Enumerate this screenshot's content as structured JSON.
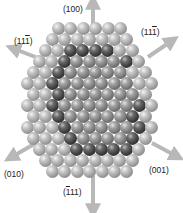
{
  "diagram": {
    "type": "crystal-facet-sphere-model",
    "colors": {
      "outer_sphere": "#a0a0a0",
      "inner_core": "#6e6e6e",
      "core_edge": "#2e2e2e",
      "arrow": "#b8b8b8",
      "label_text": "#222222"
    },
    "sphere_diameter": 13,
    "rows": [
      {
        "y": 22,
        "x0": 52,
        "n": 6,
        "inner": [],
        "edge": []
      },
      {
        "y": 33,
        "x0": 46,
        "n": 7,
        "inner": [],
        "edge": []
      },
      {
        "y": 44,
        "x0": 39,
        "n": 8,
        "inner": [
          3,
          4,
          5
        ],
        "edge": [
          2,
          3,
          4,
          5
        ]
      },
      {
        "y": 55,
        "x0": 33,
        "n": 9,
        "inner": [
          3,
          4,
          5,
          6
        ],
        "edge": [
          2,
          7
        ]
      },
      {
        "y": 66,
        "x0": 27,
        "n": 10,
        "inner": [
          3,
          4,
          5,
          6,
          7
        ],
        "edge": [
          2
        ]
      },
      {
        "y": 77,
        "x0": 21,
        "n": 11,
        "inner": [
          3,
          4,
          5,
          6,
          7,
          8
        ],
        "edge": [
          2
        ]
      },
      {
        "y": 88,
        "x0": 27,
        "n": 10,
        "inner": [
          3,
          4,
          5,
          6,
          7,
          8
        ],
        "edge": [
          2
        ]
      },
      {
        "y": 99,
        "x0": 21,
        "n": 11,
        "inner": [
          3,
          4,
          5,
          6,
          7,
          8
        ],
        "edge": [
          2,
          9
        ]
      },
      {
        "y": 110,
        "x0": 27,
        "n": 10,
        "inner": [
          3,
          4,
          5,
          6,
          7,
          8
        ],
        "edge": [
          2,
          8
        ]
      },
      {
        "y": 121,
        "x0": 21,
        "n": 11,
        "inner": [
          4,
          5,
          6,
          7,
          8
        ],
        "edge": [
          3,
          9
        ]
      },
      {
        "y": 132,
        "x0": 27,
        "n": 10,
        "inner": [
          4,
          5,
          6,
          7
        ],
        "edge": [
          3,
          8
        ]
      },
      {
        "y": 143,
        "x0": 33,
        "n": 9,
        "inner": [
          4,
          5,
          6
        ],
        "edge": [
          3,
          4,
          5,
          6,
          7
        ]
      },
      {
        "y": 154,
        "x0": 39,
        "n": 8,
        "inner": [],
        "edge": []
      },
      {
        "y": 165,
        "x0": 46,
        "n": 7,
        "inner": [],
        "edge": []
      }
    ],
    "labels": [
      {
        "id": "100",
        "text": "(100)",
        "x": 63,
        "y": 5,
        "overbar": []
      },
      {
        "id": "11-1",
        "text": "(111)",
        "x": 14,
        "y": 37,
        "overbar": [
          3
        ]
      },
      {
        "id": "11-1-right",
        "text": "(111)",
        "x": 141,
        "y": 28,
        "overbar": [
          3
        ]
      },
      {
        "id": "010",
        "text": "(010)",
        "x": 4,
        "y": 170,
        "overbar": []
      },
      {
        "id": "001",
        "text": "(001)",
        "x": 149,
        "y": 166,
        "overbar": []
      },
      {
        "id": "-111",
        "text": "(111)",
        "x": 63,
        "y": 188,
        "overbar": [
          1
        ]
      }
    ],
    "arrows": [
      {
        "direction": "(100)",
        "x1": 93,
        "y1": 40,
        "x2": 93,
        "y2": 1
      },
      {
        "direction": "(111) upper-left",
        "x1": 38,
        "y1": 58,
        "x2": 12,
        "y2": 48
      },
      {
        "direction": "(111) upper-right",
        "x1": 148,
        "y1": 57,
        "x2": 173,
        "y2": 40
      },
      {
        "direction": "(010)",
        "x1": 36,
        "y1": 143,
        "x2": 10,
        "y2": 158
      },
      {
        "direction": "(001)",
        "x1": 152,
        "y1": 143,
        "x2": 178,
        "y2": 157
      },
      {
        "direction": "(-111)",
        "x1": 93,
        "y1": 176,
        "x2": 93,
        "y2": 212
      }
    ]
  }
}
